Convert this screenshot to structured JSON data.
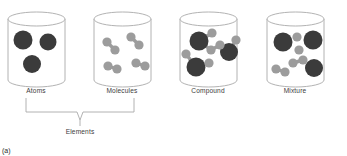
{
  "figure": {
    "caption": "(a)",
    "group_label": "Elements",
    "palette": {
      "large_particle": "#3b3b3b",
      "small_particle": "#9c9c9c",
      "vessel_outline": "#a9a9a9",
      "label_text": "#3c3c3c",
      "background": "#ffffff"
    },
    "brace": {
      "left_x": 26,
      "right_x": 134,
      "center_x": 80,
      "top_y": 98,
      "bottom_y": 112,
      "tip_y": 120,
      "spans": [
        "Atoms",
        "Molecules"
      ]
    }
  },
  "containers": [
    {
      "id": "atoms",
      "label": "Atoms",
      "center_x": 36,
      "label_x": 36,
      "label_y": 93,
      "vessel": {
        "x": 8,
        "y": 12,
        "width": 57,
        "height": 68,
        "ellipse_ry": 7
      },
      "particles": [
        {
          "type": "large",
          "cx": 23,
          "cy": 40,
          "r": 9.5
        },
        {
          "type": "large",
          "cx": 48,
          "cy": 42,
          "r": 8.5
        },
        {
          "type": "large",
          "cx": 32,
          "cy": 64,
          "r": 9.0
        }
      ],
      "bonds": []
    },
    {
      "id": "molecules",
      "label": "Molecules",
      "center_x": 122,
      "label_x": 122,
      "label_y": 93,
      "vessel": {
        "x": 94,
        "y": 12,
        "width": 57,
        "height": 68,
        "ellipse_ry": 7
      },
      "particles": [
        {
          "type": "small",
          "cx": 107,
          "cy": 42,
          "r": 4.6
        },
        {
          "type": "small",
          "cx": 115,
          "cy": 50,
          "r": 4.6
        },
        {
          "type": "small",
          "cx": 131,
          "cy": 37,
          "r": 4.6
        },
        {
          "type": "small",
          "cx": 139,
          "cy": 45,
          "r": 4.6
        },
        {
          "type": "small",
          "cx": 108,
          "cy": 66,
          "r": 4.6
        },
        {
          "type": "small",
          "cx": 117,
          "cy": 69,
          "r": 4.6
        },
        {
          "type": "small",
          "cx": 136,
          "cy": 63,
          "r": 4.6
        },
        {
          "type": "small",
          "cx": 145,
          "cy": 66,
          "r": 4.6
        }
      ],
      "bonds": [
        {
          "x1": 107,
          "y1": 42,
          "x2": 115,
          "y2": 50
        },
        {
          "x1": 131,
          "y1": 37,
          "x2": 139,
          "y2": 45
        },
        {
          "x1": 108,
          "y1": 66,
          "x2": 117,
          "y2": 69
        },
        {
          "x1": 136,
          "y1": 63,
          "x2": 145,
          "y2": 66
        }
      ]
    },
    {
      "id": "compound",
      "label": "Compound",
      "center_x": 208,
      "label_x": 208,
      "label_y": 93,
      "vessel": {
        "x": 180,
        "y": 12,
        "width": 57,
        "height": 68,
        "ellipse_ry": 7
      },
      "particles": [
        {
          "type": "large",
          "cx": 199,
          "cy": 41,
          "r": 9.5
        },
        {
          "type": "small",
          "cx": 212,
          "cy": 33,
          "r": 4.6
        },
        {
          "type": "small",
          "cx": 211,
          "cy": 50,
          "r": 4.6
        },
        {
          "type": "large",
          "cx": 229,
          "cy": 52,
          "r": 9.0
        },
        {
          "type": "small",
          "cx": 220,
          "cy": 45,
          "r": 4.6
        },
        {
          "type": "small",
          "cx": 236,
          "cy": 40,
          "r": 4.6
        },
        {
          "type": "large",
          "cx": 196,
          "cy": 67,
          "r": 9.5
        },
        {
          "type": "small",
          "cx": 186,
          "cy": 54,
          "r": 4.6
        },
        {
          "type": "small",
          "cx": 209,
          "cy": 63,
          "r": 4.6
        }
      ],
      "bonds": [
        {
          "x1": 199,
          "y1": 41,
          "x2": 212,
          "y2": 33
        },
        {
          "x1": 199,
          "y1": 41,
          "x2": 211,
          "y2": 50
        },
        {
          "x1": 229,
          "y1": 52,
          "x2": 220,
          "y2": 45
        },
        {
          "x1": 229,
          "y1": 52,
          "x2": 236,
          "y2": 40
        },
        {
          "x1": 196,
          "y1": 67,
          "x2": 186,
          "y2": 54
        },
        {
          "x1": 196,
          "y1": 67,
          "x2": 209,
          "y2": 63
        },
        {
          "x1": 211,
          "y1": 50,
          "x2": 220,
          "y2": 45
        }
      ]
    },
    {
      "id": "mixture",
      "label": "Mixture",
      "center_x": 295,
      "label_x": 295,
      "label_y": 93,
      "vessel": {
        "x": 267,
        "y": 12,
        "width": 57,
        "height": 68,
        "ellipse_ry": 7
      },
      "particles": [
        {
          "type": "large",
          "cx": 283,
          "cy": 42,
          "r": 9.5
        },
        {
          "type": "large",
          "cx": 313,
          "cy": 40,
          "r": 9.5
        },
        {
          "type": "large",
          "cx": 314,
          "cy": 68,
          "r": 9.0
        },
        {
          "type": "small",
          "cx": 297,
          "cy": 37,
          "r": 4.6
        },
        {
          "type": "small",
          "cx": 299,
          "cy": 50,
          "r": 4.6
        },
        {
          "type": "small",
          "cx": 303,
          "cy": 60,
          "r": 4.6
        },
        {
          "type": "small",
          "cx": 293,
          "cy": 63,
          "r": 4.6
        },
        {
          "type": "small",
          "cx": 276,
          "cy": 69,
          "r": 4.6
        },
        {
          "type": "small",
          "cx": 285,
          "cy": 72,
          "r": 4.6
        }
      ],
      "bonds": [
        {
          "x1": 303,
          "y1": 60,
          "x2": 293,
          "y2": 63
        },
        {
          "x1": 276,
          "y1": 69,
          "x2": 285,
          "y2": 72
        }
      ]
    }
  ]
}
